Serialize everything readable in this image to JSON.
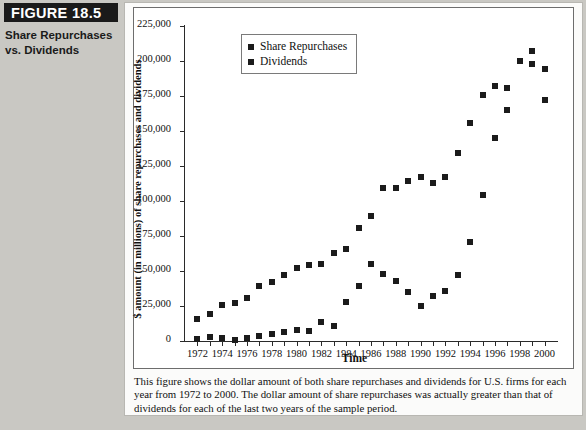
{
  "figure": {
    "banner_label": "FIGURE 18.5",
    "subtitle": "Share Repurchases\nvs. Dividends"
  },
  "caption": "This figure shows the dollar amount of both share repurchases and dividends for U.S. firms for each year from 1972 to 2000. The dollar amount of share repurchases was actually greater than that of dividends for each of the last two years of the sample period.",
  "colors": {
    "marker": "#1b1b1b",
    "axis": "#2a2a2a",
    "page_background": "#c9c8c3",
    "panel_background": "#fbfbfa",
    "plot_background": "#ffffff",
    "banner_background": "#1a1a1a",
    "banner_text": "#ffffff"
  },
  "chart_data": {
    "type": "scatter",
    "title": "",
    "xlabel": "Time",
    "ylabel": "$ amount (in millions) of share repurchases and dividends",
    "xlim": [
      1971,
      2001
    ],
    "ylim": [
      0,
      225000
    ],
    "grid": false,
    "legend_position": "top-left",
    "y_ticks": [
      0,
      25000,
      50000,
      75000,
      100000,
      125000,
      150000,
      175000,
      200000,
      225000
    ],
    "y_tick_labels": [
      "0",
      "25,000",
      "50,000",
      "75,000",
      "100,000",
      "125,000",
      "150,000",
      "175,000",
      "200,000",
      "225,000"
    ],
    "x_ticks": [
      1972,
      1973,
      1974,
      1975,
      1976,
      1977,
      1978,
      1979,
      1980,
      1981,
      1982,
      1983,
      1984,
      1985,
      1986,
      1987,
      1988,
      1989,
      1990,
      1991,
      1992,
      1993,
      1994,
      1995,
      1996,
      1997,
      1998,
      1999,
      2000
    ],
    "x_tick_labels": [
      "1972",
      "",
      "1974",
      "",
      "1976",
      "",
      "1978",
      "",
      "1980",
      "",
      "1982",
      "",
      "1984",
      "",
      "1986",
      "",
      "1988",
      "",
      "1990",
      "",
      "1992",
      "",
      "1994",
      "",
      "1996",
      "",
      "1998",
      "",
      "2000"
    ],
    "x": [
      1972,
      1973,
      1974,
      1975,
      1976,
      1977,
      1978,
      1979,
      1980,
      1981,
      1982,
      1983,
      1984,
      1985,
      1986,
      1987,
      1988,
      1989,
      1990,
      1991,
      1992,
      1993,
      1994,
      1995,
      1996,
      1997,
      1998,
      1999,
      2000
    ],
    "series": [
      {
        "name": "Share Repurchases",
        "values": [
          1500,
          3000,
          1800,
          800,
          1800,
          3500,
          5000,
          6500,
          8000,
          7500,
          13500,
          11000,
          28000,
          39000,
          55000,
          48000,
          43000,
          35000,
          25000,
          32000,
          36000,
          47000,
          71000,
          104000,
          145000,
          181000,
          200000,
          207000,
          194000
        ]
      },
      {
        "name": "Dividends",
        "values": [
          16000,
          19000,
          26000,
          27500,
          31000,
          39000,
          42000,
          47000,
          52000,
          54000,
          55000,
          63000,
          66000,
          81000,
          89000,
          109000,
          109000,
          114000,
          117000,
          113000,
          117000,
          134000,
          156000,
          176000,
          182000,
          165000,
          200000,
          198000,
          172000
        ]
      }
    ]
  }
}
